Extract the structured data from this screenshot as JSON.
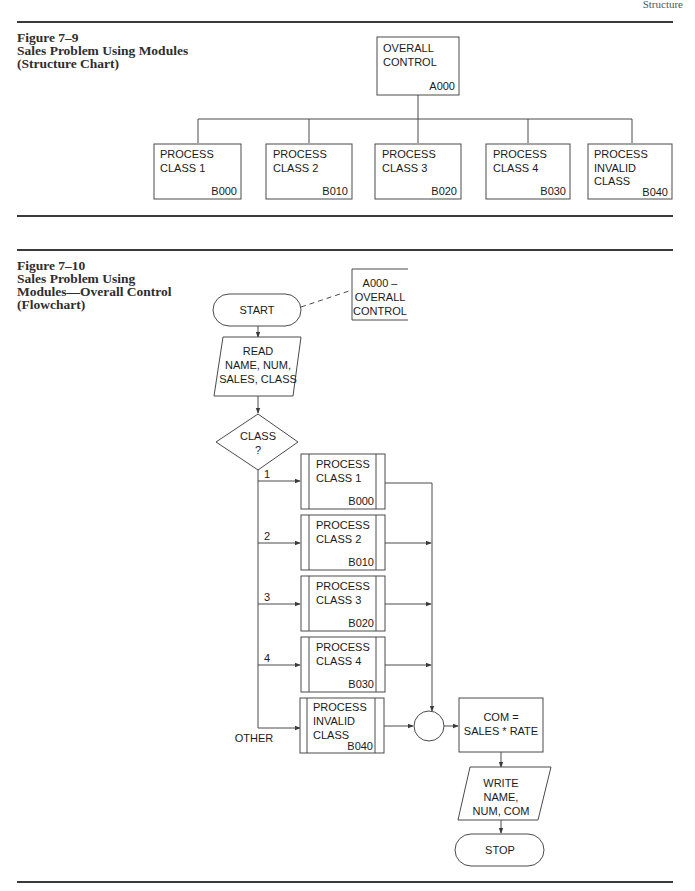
{
  "page_header": "Structure",
  "figure_7_9": {
    "caption": [
      "Figure 7–9",
      "Sales Problem Using Modules",
      "(Structure Chart)"
    ],
    "root": {
      "lines": [
        "OVERALL",
        "CONTROL"
      ],
      "code": "A000"
    },
    "children": [
      {
        "lines": [
          "PROCESS",
          "CLASS 1"
        ],
        "code": "B000"
      },
      {
        "lines": [
          "PROCESS",
          "CLASS 2"
        ],
        "code": "B010"
      },
      {
        "lines": [
          "PROCESS",
          "CLASS 3"
        ],
        "code": "B020"
      },
      {
        "lines": [
          "PROCESS",
          "CLASS 4"
        ],
        "code": "B030"
      },
      {
        "lines": [
          "PROCESS",
          "INVALID",
          "CLASS"
        ],
        "code": "B040"
      }
    ]
  },
  "figure_7_10": {
    "caption": [
      "Figure 7–10",
      "Sales Problem Using",
      "Modules—Overall Control",
      "(Flowchart)"
    ],
    "annotation": [
      "A000 –",
      "OVERALL",
      "CONTROL"
    ],
    "start": "START",
    "read": [
      "READ",
      "NAME, NUM,",
      "SALES, CLASS"
    ],
    "decision": [
      "CLASS",
      "?"
    ],
    "branches": [
      {
        "label": "1",
        "lines": [
          "PROCESS",
          "CLASS 1"
        ],
        "code": "B000"
      },
      {
        "label": "2",
        "lines": [
          "PROCESS",
          "CLASS 2"
        ],
        "code": "B010"
      },
      {
        "label": "3",
        "lines": [
          "PROCESS",
          "CLASS 3"
        ],
        "code": "B020"
      },
      {
        "label": "4",
        "lines": [
          "PROCESS",
          "CLASS 4"
        ],
        "code": "B030"
      },
      {
        "label": "OTHER",
        "lines": [
          "PROCESS",
          "INVALID",
          "CLASS"
        ],
        "code": "B040"
      }
    ],
    "compute": [
      "COM =",
      "SALES * RATE"
    ],
    "write": [
      "WRITE",
      "NAME,",
      "NUM, COM"
    ],
    "stop": "STOP"
  }
}
